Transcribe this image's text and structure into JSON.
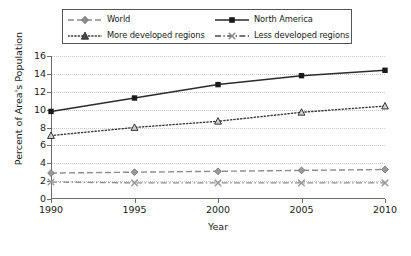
{
  "chart_data": {
    "type": "line",
    "title": "",
    "xlabel": "Year",
    "ylabel": "Percent of Area's Population",
    "x": [
      1990,
      1995,
      2000,
      2005,
      2010
    ],
    "xtick_labels": [
      "1990",
      "1995",
      "2000",
      "2005",
      "2010"
    ],
    "xlim": [
      1990,
      2010
    ],
    "ylim": [
      0,
      16
    ],
    "yticks": [
      0,
      2,
      4,
      6,
      8,
      10,
      12,
      14,
      16
    ],
    "ytick_labels": [
      "0",
      "2",
      "4",
      "6",
      "8",
      "10",
      "12",
      "14",
      "16"
    ],
    "grid": "horizontal-dotted",
    "legend_position": "top-outside",
    "series": [
      {
        "name": "World",
        "values": [
          2.9,
          3.0,
          3.1,
          3.2,
          3.3
        ],
        "marker": "diamond",
        "line_style": "dashed",
        "color": "#8c8c8c"
      },
      {
        "name": "North America",
        "values": [
          9.8,
          11.3,
          12.8,
          13.8,
          14.4
        ],
        "marker": "square",
        "line_style": "solid",
        "color": "#2b2b2b"
      },
      {
        "name": "More developed regions",
        "values": [
          7.1,
          8.0,
          8.7,
          9.7,
          10.4
        ],
        "marker": "triangle",
        "line_style": "dotted",
        "color": "#3a3a3a"
      },
      {
        "name": "Less developed regions",
        "values": [
          1.9,
          1.8,
          1.8,
          1.8,
          1.8
        ],
        "marker": "x",
        "line_style": "dash-dot",
        "color": "#8c8c8c"
      }
    ]
  },
  "legend": {
    "entries": [
      {
        "label": "World",
        "row": 0,
        "col": 0
      },
      {
        "label": "North America",
        "row": 0,
        "col": 1
      },
      {
        "label": "More developed regions",
        "row": 1,
        "col": 0
      },
      {
        "label": "Less developed regions",
        "row": 1,
        "col": 1
      }
    ]
  }
}
